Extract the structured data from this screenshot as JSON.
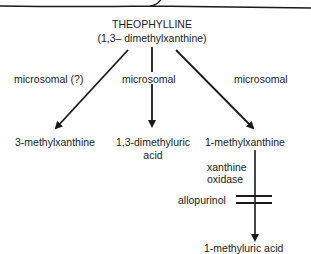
{
  "title": "THEOPHYLLINE",
  "subtitle": "(1,3– dimethylxanthine)",
  "pathways": [
    {
      "enzyme": "microsomal (?)",
      "product": "3-methylxanthine"
    },
    {
      "enzyme": "microsomal",
      "product_line1": "1,3-dimethyluric",
      "product_line2": "acid"
    },
    {
      "enzyme": "microsomal",
      "product": "1-methylxanthine"
    }
  ],
  "secondary": {
    "enzyme_line1": "xanthine",
    "enzyme_line2": "oxidase",
    "inhibitor": "allopurinol",
    "product": "1-methyluric acid"
  },
  "colors": {
    "ink": "#1a1a1a",
    "background": "#ffffff"
  }
}
